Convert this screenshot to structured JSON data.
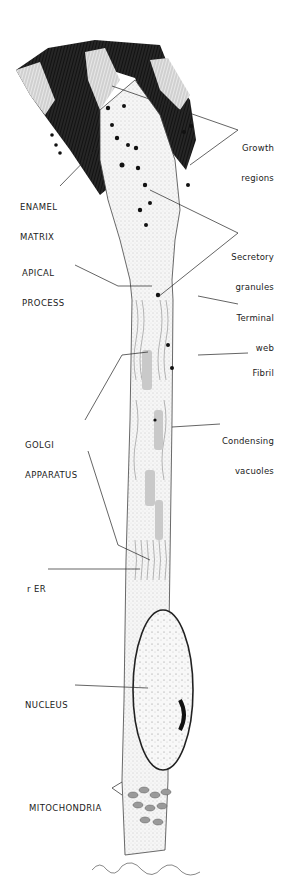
{
  "diagram": {
    "labels_left": [
      {
        "id": "enamel_matrix",
        "lines": [
          "ENAMEL",
          "MATRIX"
        ]
      },
      {
        "id": "apical_process",
        "lines": [
          "APICAL",
          "PROCESS"
        ]
      },
      {
        "id": "golgi_apparatus",
        "lines": [
          "GOLGI",
          "APPARATUS"
        ]
      },
      {
        "id": "rer",
        "lines": [
          "r ER"
        ]
      },
      {
        "id": "nucleus",
        "lines": [
          "NUCLEUS"
        ]
      },
      {
        "id": "mitochondria",
        "lines": [
          "MITOCHONDRIA"
        ]
      }
    ],
    "labels_right": [
      {
        "id": "growth_regions",
        "lines": [
          "Growth",
          "regions"
        ]
      },
      {
        "id": "secretory_granules",
        "lines": [
          "Secretory",
          "granules"
        ]
      },
      {
        "id": "terminal_web",
        "lines": [
          "Terminal",
          "web"
        ]
      },
      {
        "id": "fibril",
        "lines": [
          "Fibril"
        ]
      },
      {
        "id": "condensing_vacuoles",
        "lines": [
          "Condensing",
          "vacuoles"
        ]
      }
    ],
    "colors": {
      "ink": "#1a1a1a",
      "paper": "#ffffff",
      "enamel": "#111111",
      "cytoplasm": "#f2f2f2"
    }
  }
}
